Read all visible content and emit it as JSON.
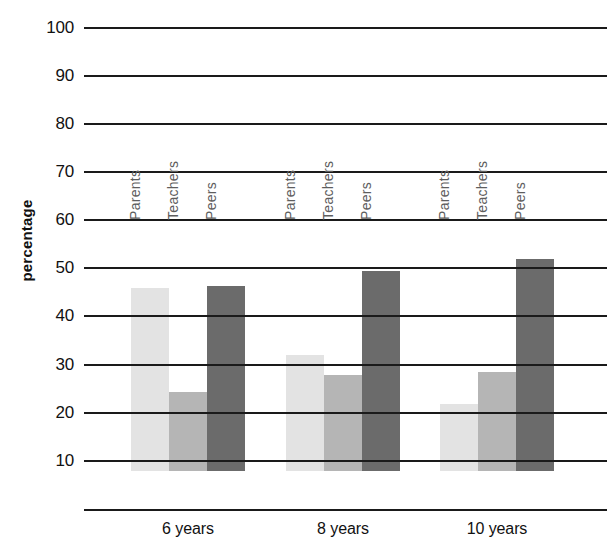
{
  "chart_data": {
    "type": "bar",
    "title": "",
    "subtitle": "",
    "xlabel": "",
    "ylabel": "percentage",
    "categories": [
      "6 years",
      "8 years",
      "10 years"
    ],
    "series": [
      {
        "name": "Parents",
        "values": [
          38,
          24,
          14
        ],
        "color": "#e3e3e3"
      },
      {
        "name": "Teachers",
        "values": [
          16.5,
          20,
          20.5
        ],
        "color": "#b5b5b5"
      },
      {
        "name": "Peers",
        "values": [
          38.5,
          41.5,
          44
        ],
        "color": "#6b6b6b"
      }
    ],
    "ylim": [
      0,
      100
    ],
    "ytick_labels": [
      "100",
      "90",
      "80",
      "70",
      "60",
      "50",
      "40",
      "30",
      "20",
      "10"
    ],
    "ytick_values": [
      100,
      90,
      80,
      70,
      60,
      50,
      40,
      30,
      20,
      10
    ],
    "grid": true,
    "grid_color": "#1a1a1a",
    "legend": "in-plot-rotated-labels",
    "bar_labels_rotated": true
  },
  "axis": {
    "y_title": "percentage"
  }
}
